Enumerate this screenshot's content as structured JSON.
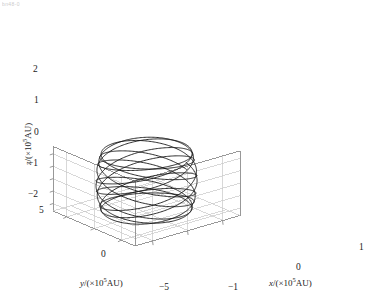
{
  "figure": {
    "artifact_text": "bn48-0",
    "background": "#ffffff",
    "frame_color": "#8d8d8d",
    "grid_color": "#c8c8c8",
    "trace_color": "#151515"
  },
  "axes": {
    "x": {
      "label_var": "x",
      "label_unit": "/(×10",
      "label_exp": "5",
      "label_tail": "AU)",
      "ticks": [
        "−1",
        "0",
        "1"
      ],
      "range": [
        -1.5,
        1.5
      ]
    },
    "y": {
      "label_var": "y",
      "label_unit": "/(×10",
      "label_exp": "5",
      "label_tail": "AU)",
      "ticks": [
        "5",
        "0",
        "−5"
      ],
      "range": [
        -7.5,
        7.5
      ]
    },
    "z": {
      "label_var": "z",
      "label_unit": "/(×10",
      "label_exp": "5",
      "label_tail": "AU)",
      "ticks": [
        "2",
        "1",
        "0",
        "−1",
        "−2"
      ],
      "range": [
        -2.6,
        2.6
      ]
    }
  },
  "chart_data": {
    "type": "line",
    "title": "",
    "xlabel": "x/(×10^5 AU)",
    "ylabel": "y/(×10^5 AU)",
    "zlabel": "z/(×10^5 AU)",
    "xlim": [
      -1.5,
      1.5
    ],
    "ylim": [
      -7.5,
      7.5
    ],
    "zlim": [
      -2.6,
      2.6
    ],
    "xticks": [
      -1,
      0,
      1
    ],
    "yticks": [
      5,
      0,
      -5
    ],
    "zticks": [
      2,
      1,
      0,
      -1,
      -2
    ],
    "grid": true,
    "legend": null,
    "projection": "3d",
    "series": [
      {
        "name": "orbit-trajectory",
        "kind": "parametric-3d",
        "color": "#151515",
        "linewidth": 0.9,
        "n_loops": 12,
        "samples": 2600,
        "model": {
          "x": "r*cos(t)",
          "y": "r*sin(t)",
          "z": "A*sin(k*t + phi)",
          "r": 1.08,
          "A": 2.25,
          "k": 0.42,
          "phi": 0.0,
          "t_range": [
            0,
            75.4
          ]
        }
      }
    ]
  }
}
